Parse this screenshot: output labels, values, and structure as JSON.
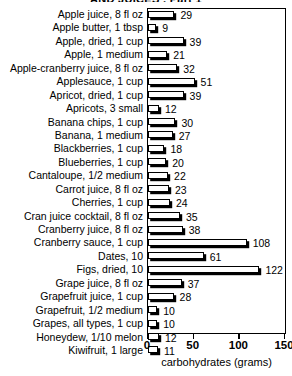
{
  "chart_data": {
    "type": "bar",
    "orientation": "horizontal",
    "title": "AND JUICES , Part 1",
    "xlabel": "carbohydrates (grams)",
    "ylabel": "",
    "xlim": [
      0,
      150
    ],
    "xticks": [
      0,
      50,
      100,
      150
    ],
    "grid": false,
    "legend": null,
    "categories": [
      "Apple juice, 8 fl oz",
      "Apple butter, 1 tbsp",
      "Apple, dried, 1 cup",
      "Apple, 1 medium",
      "Apple-cranberry juice, 8 fl oz",
      "Applesauce, 1 cup",
      "Apricot, dried, 1 cup",
      "Apricots, 3 small",
      "Banana chips, 1 cup",
      "Banana, 1 medium",
      "Blackberries, 1 cup",
      "Blueberries, 1 cup",
      "Cantaloupe, 1/2 medium",
      "Carrot juice, 8 fl oz",
      "Cherries, 1 cup",
      "Cran juice cocktail, 8 fl oz",
      "Cranberry juice, 8 fl oz",
      "Cranberry sauce, 1 cup",
      "Dates, 10",
      "Figs, dried, 10",
      "Grape juice, 8 fl oz",
      "Grapefruit juice, 1 cup",
      "Grapefruit, 1/2 medium",
      "Grapes, all types, 1 cup",
      "Honeydew, 1/10 melon",
      "Kiwifruit, 1 large"
    ],
    "values": [
      29,
      9,
      39,
      21,
      32,
      51,
      39,
      12,
      30,
      27,
      18,
      20,
      22,
      23,
      24,
      35,
      38,
      108,
      61,
      122,
      37,
      28,
      10,
      10,
      12,
      11
    ],
    "colors": {
      "bar_fill": "#ffffff",
      "bar_outline": "#000000",
      "bar_shadow": "#000000",
      "text": "#000000",
      "background": "#ffffff"
    }
  }
}
